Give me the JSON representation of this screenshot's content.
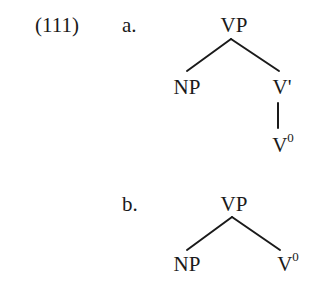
{
  "example": {
    "number": "(111)",
    "trees": [
      {
        "label": "a.",
        "root": "VP",
        "children": [
          {
            "label": "NP"
          },
          {
            "label": "V'",
            "children": [
              {
                "label": "V",
                "superscript": "0"
              }
            ]
          }
        ]
      },
      {
        "label": "b.",
        "root": "VP",
        "children": [
          {
            "label": "NP"
          },
          {
            "label": "V",
            "superscript": "0"
          }
        ]
      }
    ]
  }
}
